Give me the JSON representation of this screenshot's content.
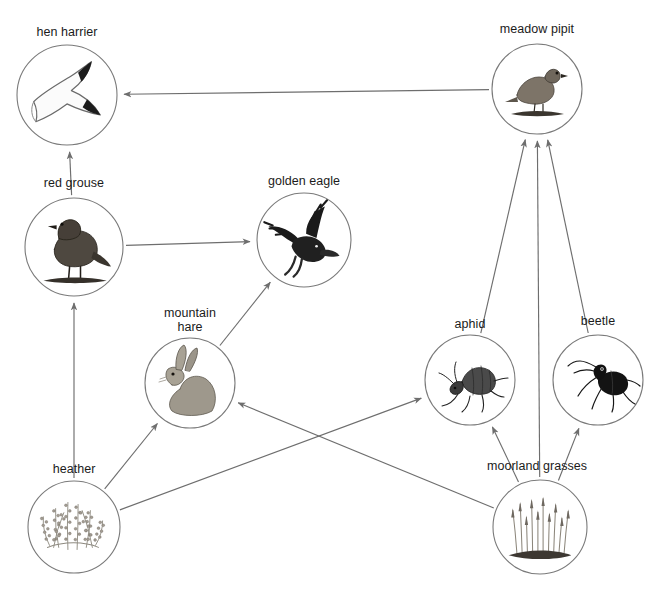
{
  "diagram": {
    "type": "food-web",
    "background_color": "#ffffff",
    "line_color": "#6e6e6e",
    "circle_stroke_color": "#7a7a7a",
    "text_color": "#1b1b1b",
    "nodes": [
      {
        "id": "hen_harrier",
        "label": "hen harrier",
        "icon": "hen-harrier-icon",
        "cx": 67,
        "cy": 95,
        "r": 50,
        "label_x": 67,
        "label_y": 25,
        "trophic": "predator"
      },
      {
        "id": "meadow_pipit",
        "label": "meadow pipit",
        "icon": "meadow-pipit-icon",
        "cx": 537,
        "cy": 89,
        "r": 45,
        "label_x": 537,
        "label_y": 22,
        "trophic": "consumer"
      },
      {
        "id": "red_grouse",
        "label": "red grouse",
        "icon": "red-grouse-icon",
        "cx": 74,
        "cy": 247,
        "r": 49,
        "label_x": 74,
        "label_y": 176,
        "trophic": "consumer"
      },
      {
        "id": "golden_eagle",
        "label": "golden eagle",
        "icon": "golden-eagle-icon",
        "cx": 304,
        "cy": 240,
        "r": 47,
        "label_x": 304,
        "label_y": 174,
        "trophic": "predator"
      },
      {
        "id": "mountain_hare",
        "label": "mountain\nhare",
        "icon": "mountain-hare-icon",
        "cx": 190,
        "cy": 383,
        "r": 45,
        "label_x": 190,
        "label_y": 306,
        "trophic": "consumer"
      },
      {
        "id": "aphid",
        "label": "aphid",
        "icon": "aphid-icon",
        "cx": 470,
        "cy": 380,
        "r": 45,
        "label_x": 470,
        "label_y": 317,
        "trophic": "consumer"
      },
      {
        "id": "beetle",
        "label": "beetle",
        "icon": "beetle-icon",
        "cx": 598,
        "cy": 380,
        "r": 45,
        "label_x": 598,
        "label_y": 314,
        "trophic": "consumer"
      },
      {
        "id": "heather",
        "label": "heather",
        "icon": "heather-icon",
        "cx": 74,
        "cy": 527,
        "r": 46,
        "label_x": 74,
        "label_y": 462,
        "trophic": "producer"
      },
      {
        "id": "moorland_grasses",
        "label": "moorland grasses",
        "icon": "moorland-grasses-icon",
        "cx": 540,
        "cy": 527,
        "r": 47,
        "label_x": 537,
        "label_y": 459,
        "trophic": "producer"
      }
    ],
    "links": [
      {
        "id": "link-meadow-pipit-to-hen-harrier",
        "from": "meadow_pipit",
        "to": "hen_harrier",
        "kind": "eaten-by"
      },
      {
        "id": "link-red-grouse-to-hen-harrier",
        "from": "red_grouse",
        "to": "hen_harrier",
        "kind": "eaten-by"
      },
      {
        "id": "link-red-grouse-to-golden-eagle",
        "from": "red_grouse",
        "to": "golden_eagle",
        "kind": "eaten-by"
      },
      {
        "id": "link-mountain-hare-to-golden-eagle",
        "from": "mountain_hare",
        "to": "golden_eagle",
        "kind": "eaten-by"
      },
      {
        "id": "link-heather-to-red-grouse",
        "from": "heather",
        "to": "red_grouse",
        "kind": "eaten-by"
      },
      {
        "id": "link-heather-to-mountain-hare",
        "from": "heather",
        "to": "mountain_hare",
        "kind": "eaten-by"
      },
      {
        "id": "link-heather-to-aphid",
        "from": "heather",
        "to": "aphid",
        "kind": "eaten-by"
      },
      {
        "id": "link-moorland-grasses-to-mountain-hare",
        "from": "moorland_grasses",
        "to": "mountain_hare",
        "kind": "eaten-by"
      },
      {
        "id": "link-moorland-grasses-to-aphid",
        "from": "moorland_grasses",
        "to": "aphid",
        "kind": "eaten-by"
      },
      {
        "id": "link-moorland-grasses-to-beetle",
        "from": "moorland_grasses",
        "to": "beetle",
        "kind": "eaten-by"
      },
      {
        "id": "link-moorland-grasses-to-meadow-pipit",
        "from": "moorland_grasses",
        "to": "meadow_pipit",
        "kind": "eaten-by"
      },
      {
        "id": "link-aphid-to-meadow-pipit",
        "from": "aphid",
        "to": "meadow_pipit",
        "kind": "eaten-by"
      },
      {
        "id": "link-beetle-to-meadow-pipit",
        "from": "beetle",
        "to": "meadow_pipit",
        "kind": "eaten-by"
      }
    ]
  }
}
